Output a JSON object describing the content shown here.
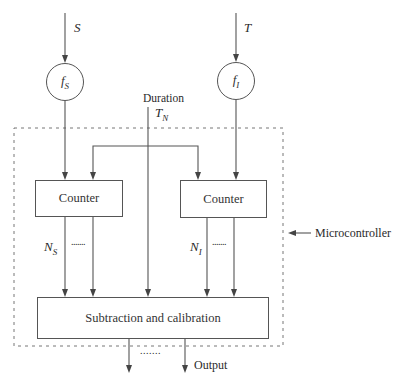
{
  "inputs": {
    "left_signal": "S",
    "right_signal": "T"
  },
  "converters": {
    "left": {
      "symbol": "f",
      "subscript": "S"
    },
    "right": {
      "symbol": "f",
      "subscript": "I"
    }
  },
  "duration": {
    "label": "Duration",
    "symbol": "T",
    "subscript": "N"
  },
  "counters": {
    "left": {
      "label": "Counter",
      "output_symbol": "N",
      "output_subscript": "S",
      "dots": "......."
    },
    "right": {
      "label": "Counter",
      "output_symbol": "N",
      "output_subscript": "I",
      "dots": "......."
    }
  },
  "processor": {
    "label": "Subtraction and calibration"
  },
  "boundary": {
    "label": "Microcontroller"
  },
  "output": {
    "label": "Output",
    "dots": "......."
  },
  "colors": {
    "line": "#555555",
    "text": "#2a2a2a",
    "background": "#ffffff"
  }
}
